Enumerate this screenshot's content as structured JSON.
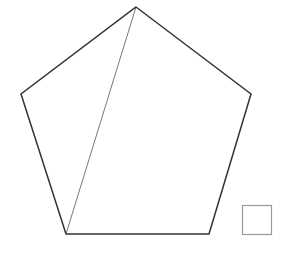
{
  "diagram": {
    "shapes": [
      {
        "name": "pentagon",
        "vertices": [
          "top",
          "right",
          "bottom-right",
          "bottom-left",
          "left"
        ]
      },
      {
        "name": "diagonal",
        "from": "top",
        "to": "bottom-left"
      },
      {
        "name": "square"
      }
    ],
    "colors": {
      "pentagon_stroke": "#333333",
      "diagonal_stroke": "#555555",
      "square_stroke": "#999999",
      "background": "#ffffff"
    }
  }
}
